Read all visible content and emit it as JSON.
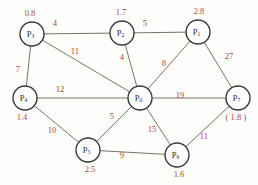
{
  "figure": {
    "background_color": "#fdfdfc",
    "edge_color": "#6b6257",
    "node_stroke_color": "#3a3a38",
    "node_fill_color": "#ffffff",
    "label_color": "#a84b32",
    "node_text_color": "#2b2b2a"
  },
  "chart_data": {
    "type": "diagram",
    "subtype": "weighted-graph",
    "title": "",
    "directed": false,
    "nodes": [
      {
        "id": "P3",
        "label_base": "P",
        "label_sub": "3",
        "value": "0.8",
        "x": 32,
        "y": 34,
        "r": 12,
        "value_x": 30,
        "value_y": 14
      },
      {
        "id": "P2",
        "label_base": "P",
        "label_sub": "2",
        "value": "1.7",
        "x": 122,
        "y": 33,
        "r": 12,
        "value_x": 121,
        "value_y": 13
      },
      {
        "id": "P1",
        "label_base": "P",
        "label_sub": "1",
        "value": "2.8",
        "x": 198,
        "y": 32,
        "r": 12,
        "value_x": 199,
        "value_y": 12
      },
      {
        "id": "P4",
        "label_base": "P",
        "label_sub": "4",
        "value": "1.4",
        "x": 25,
        "y": 98,
        "r": 12,
        "value_x": 22,
        "value_y": 118
      },
      {
        "id": "P0",
        "label_base": "P",
        "label_sub": "0",
        "value": "",
        "x": 140,
        "y": 98,
        "r": 12,
        "value_x": 140,
        "value_y": 118
      },
      {
        "id": "P7",
        "label_base": "P",
        "label_sub": "7",
        "value": "( 1.8 )",
        "x": 238,
        "y": 98,
        "r": 12,
        "value_x": 236,
        "value_y": 118
      },
      {
        "id": "P5",
        "label_base": "P",
        "label_sub": "5",
        "value": "2.5",
        "x": 88,
        "y": 150,
        "r": 12,
        "value_x": 90,
        "value_y": 170
      },
      {
        "id": "P6",
        "label_base": "P",
        "label_sub": "6",
        "value": "1.6",
        "x": 177,
        "y": 155,
        "r": 12,
        "value_x": 179,
        "value_y": 175
      }
    ],
    "edges": [
      {
        "source": "P3",
        "target": "P2",
        "weight": "4",
        "label_x": 55,
        "label_y": 24
      },
      {
        "source": "P2",
        "target": "P1",
        "weight": "5",
        "label_x": 145,
        "label_y": 24
      },
      {
        "source": "P3",
        "target": "P4",
        "weight": "7",
        "label_x": 18,
        "label_y": 70
      },
      {
        "source": "P3",
        "target": "P0",
        "weight": "11",
        "label_x": 75,
        "label_y": 52
      },
      {
        "source": "P2",
        "target": "P0",
        "weight": "4",
        "label_x": 122,
        "label_y": 58
      },
      {
        "source": "P1",
        "target": "P0",
        "weight": "8",
        "label_x": 164,
        "label_y": 64
      },
      {
        "source": "P1",
        "target": "P7",
        "weight": "27",
        "label_x": 229,
        "label_y": 57
      },
      {
        "source": "P4",
        "target": "P0",
        "weight": "12",
        "label_x": 60,
        "label_y": 90
      },
      {
        "source": "P0",
        "target": "P7",
        "weight": "19",
        "label_x": 180,
        "label_y": 96
      },
      {
        "source": "P4",
        "target": "P5",
        "weight": "10",
        "label_x": 52,
        "label_y": 131
      },
      {
        "source": "P5",
        "target": "P0",
        "weight": "5",
        "label_x": 112,
        "label_y": 117
      },
      {
        "source": "P0",
        "target": "P6",
        "weight": "15",
        "label_x": 152,
        "label_y": 130
      },
      {
        "source": "P5",
        "target": "P6",
        "weight": "9",
        "label_x": 122,
        "label_y": 156
      },
      {
        "source": "P6",
        "target": "P7",
        "weight": "11",
        "label_x": 204,
        "label_y": 137
      }
    ],
    "node_values": {
      "P3": "0.8",
      "P2": "1.7",
      "P1": "2.8",
      "P4": "1.4",
      "P7": "( 1.8 )",
      "P5": "2.5",
      "P6": "1.6"
    },
    "weights": [
      4,
      5,
      7,
      11,
      4,
      8,
      27,
      12,
      19,
      10,
      5,
      15,
      9,
      11
    ]
  }
}
